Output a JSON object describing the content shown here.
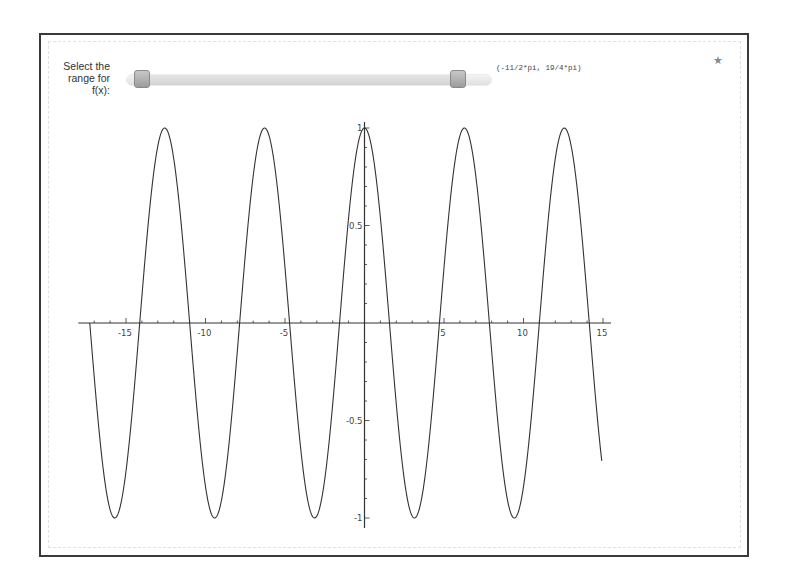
{
  "slider": {
    "label": "Select the range for f(x):",
    "label_lines": [
      "Select the",
      "range for",
      "f(x):"
    ],
    "value_text": "(-11/2*pi, 19/4*pi)",
    "min_handle": "-11/2*pi",
    "max_handle": "19/4*pi"
  },
  "icons": {
    "corner": "star-icon"
  },
  "colors": {
    "curve": "#333333",
    "axis": "#333333",
    "frame": "#3a3a3a",
    "handle": "#a8a8a8"
  },
  "chart_data": {
    "type": "line",
    "title": "",
    "function": "cos(x)",
    "xlabel": "",
    "ylabel": "",
    "domain": [
      -17.2788,
      14.9226
    ],
    "domain_text": [
      "-11/2*pi",
      "19/4*pi"
    ],
    "xlim": [
      -18,
      15.5
    ],
    "ylim": [
      -1,
      1
    ],
    "x_ticks": [
      -15,
      -10,
      -5,
      5,
      10,
      15
    ],
    "x_tick_labels": [
      "-15",
      "-10",
      "-5",
      "5",
      "10",
      "15"
    ],
    "y_ticks": [
      1,
      0.5,
      -0.5,
      -1
    ],
    "y_tick_labels": [
      "1",
      "0.5",
      "-0.5",
      "-1"
    ],
    "grid": false,
    "legend": null,
    "series": [
      {
        "name": "f(x)",
        "sample_points": {
          "x": [
            -17.28,
            -15.71,
            -14.14,
            -12.57,
            -11.0,
            -9.42,
            -7.85,
            -6.28,
            -4.71,
            -3.14,
            -1.57,
            0,
            1.57,
            3.14,
            4.71,
            6.28,
            7.85,
            9.42,
            11.0,
            12.57,
            14.14,
            14.92
          ],
          "y": [
            0,
            -1,
            0,
            1,
            0,
            -1,
            0,
            1,
            0,
            -1,
            0,
            1,
            0,
            -1,
            0,
            1,
            0,
            -1,
            0,
            1,
            0,
            -0.707
          ]
        }
      }
    ]
  }
}
